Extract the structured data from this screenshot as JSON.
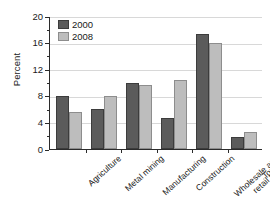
{
  "chart_data": {
    "type": "bar",
    "title": "",
    "subtitle": "",
    "xlabel": "",
    "ylabel": "Percent",
    "ylim": [
      0,
      20
    ],
    "yticks": [
      0,
      4,
      8,
      12,
      16,
      20
    ],
    "ytick_labels": [
      "0",
      "4",
      "8",
      "12",
      "16",
      "20"
    ],
    "yminor_ticks": [
      2,
      6,
      10,
      14,
      18
    ],
    "grid": "horizontal",
    "legend_position": "top-left",
    "categories": [
      "Agriculture",
      "Metal mining",
      "Manufacturing",
      "Construction",
      "Wholesale and\nretail trade",
      "Tourism"
    ],
    "series": [
      {
        "name": "2000",
        "color": "#5b5b5b",
        "values": [
          8.0,
          6.0,
          9.9,
          4.7,
          17.3,
          1.8
        ]
      },
      {
        "name": "2008",
        "color": "#bdbdbd",
        "values": [
          5.5,
          8.0,
          9.6,
          10.4,
          16.0,
          2.6
        ]
      }
    ]
  }
}
